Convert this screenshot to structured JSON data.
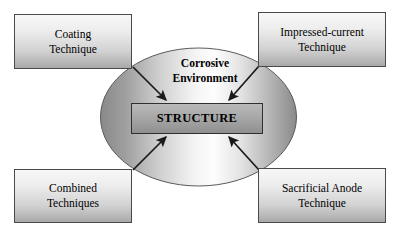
{
  "diagram": {
    "center_ellipse": {
      "label_line1": "Corrosive",
      "label_line2": "Environment"
    },
    "center_box": {
      "label": "STRUCTURE"
    },
    "corner_boxes": [
      {
        "id": "coating",
        "line1": "Coating",
        "line2": "Technique"
      },
      {
        "id": "impressed",
        "line1": "Impressed-current",
        "line2": "Technique"
      },
      {
        "id": "combined",
        "line1": "Combined",
        "line2": "Techniques"
      },
      {
        "id": "sacrificial",
        "line1": "Sacrificial Anode",
        "line2": "Technique"
      }
    ],
    "arrows": [
      {
        "id": "arrow-coating-to-structure",
        "from": "coating",
        "to": "structure"
      },
      {
        "id": "arrow-impressed-to-structure",
        "from": "impressed",
        "to": "structure"
      },
      {
        "id": "arrow-combined-to-structure",
        "from": "combined",
        "to": "structure"
      },
      {
        "id": "arrow-sacrificial-to-structure",
        "from": "sacrificial",
        "to": "structure"
      }
    ],
    "colors": {
      "outline": "#4a4a4a",
      "arrow": "#1a1a1a",
      "ellipse_edge": "#8d8d8d",
      "ellipse_center": "#fcfcfc",
      "structure_fill": "#a8a8a8",
      "background": "#ffffff"
    }
  }
}
